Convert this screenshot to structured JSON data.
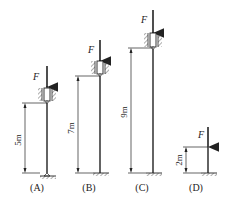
{
  "figure": {
    "force_label": "F",
    "columns": [
      {
        "id": "A",
        "caption": "(A)",
        "length_label": "5m",
        "support_top": "sliding sleeve (guided)",
        "support_bottom": "pinned"
      },
      {
        "id": "B",
        "caption": "(B)",
        "length_label": "7m",
        "support_top": "sliding sleeve (guided)",
        "support_bottom": "fixed"
      },
      {
        "id": "C",
        "caption": "(C)",
        "length_label": "9m",
        "support_top": "sliding sleeve (guided)",
        "support_bottom": "fixed"
      },
      {
        "id": "D",
        "caption": "(D)",
        "length_label": "2m",
        "support_top": "free",
        "support_bottom": "fixed"
      }
    ]
  }
}
